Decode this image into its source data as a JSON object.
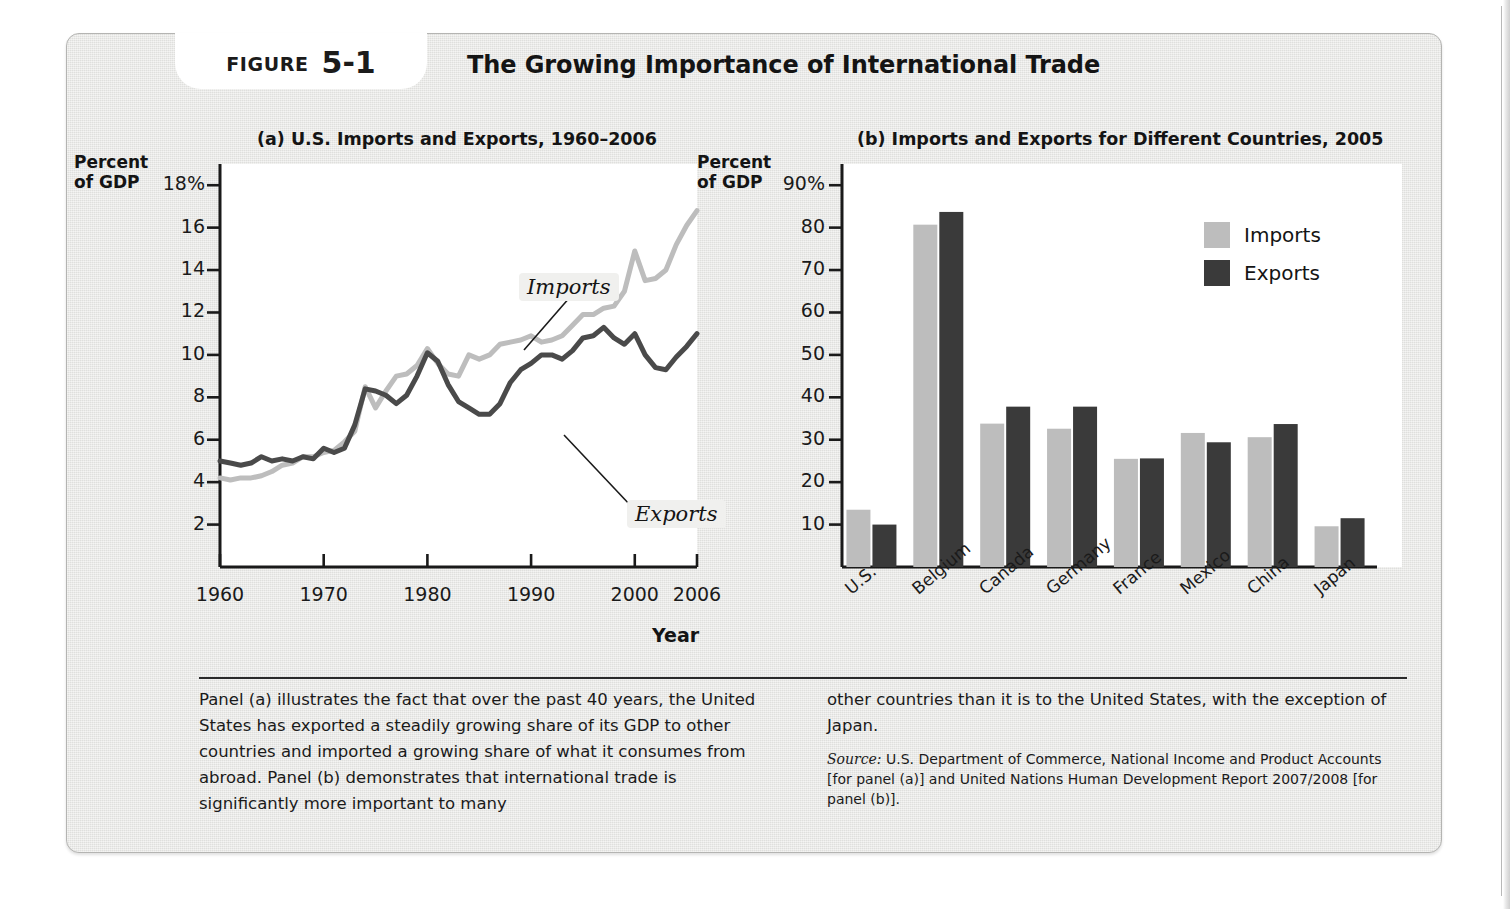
{
  "figure": {
    "label_word": "FIGURE",
    "number": "5-1",
    "title": "The Growing Importance of International Trade"
  },
  "panel_a": {
    "heading": "(a) U.S. Imports and Exports, 1960–2006",
    "y_axis_title_line1": "Percent",
    "y_axis_title_line2": "of GDP",
    "x_axis_title": "Year",
    "callouts": {
      "imports": "Imports",
      "exports": "Exports"
    }
  },
  "panel_b": {
    "heading": "(b) Imports and Exports for Different Countries, 2005",
    "y_axis_title_line1": "Percent",
    "y_axis_title_line2": "of GDP",
    "legend": [
      {
        "label": "Imports",
        "color": "#bdbdbd"
      },
      {
        "label": "Exports",
        "color": "#3a3a3a"
      }
    ]
  },
  "caption": {
    "left": "Panel (a) illustrates the fact that over the past 40 years, the United States has exported a steadily growing share of its GDP to other countries and imported a growing share of what it consumes from abroad. Panel (b) demonstrates that international trade is significantly more important to many",
    "right": "other countries than it is to the United States, with the exception of Japan.",
    "source_word": "Source:",
    "source_text": " U.S. Department of Commerce, National Income and Product Accounts [for panel (a)] and United Nations Human Development Report 2007/2008 [for panel (b)]."
  },
  "colors": {
    "imports": "#bdbdbd",
    "exports": "#4a4a4a",
    "axis": "#1a1a1a",
    "panel_bg": "#e6e6e4",
    "plot_bg": "#ffffff"
  },
  "chart_data": [
    {
      "type": "line",
      "title": "(a) U.S. Imports and Exports, 1960–2006",
      "xlabel": "Year",
      "ylabel": "Percent of GDP",
      "xlim": [
        1960,
        2006
      ],
      "ylim": [
        0,
        19
      ],
      "xticks": [
        1960,
        1970,
        1980,
        1990,
        2000,
        2006
      ],
      "xtick_labels": [
        "1960",
        "1970",
        "1980",
        "1990",
        "2000",
        "2006"
      ],
      "yticks": [
        2,
        4,
        6,
        8,
        10,
        12,
        14,
        16,
        18
      ],
      "ytick_labels": [
        "2",
        "4",
        "6",
        "8",
        "10",
        "12",
        "14",
        "16",
        "18%"
      ],
      "grid": false,
      "legend": "inline-callout",
      "x": [
        1960,
        1961,
        1962,
        1963,
        1964,
        1965,
        1966,
        1967,
        1968,
        1969,
        1970,
        1971,
        1972,
        1973,
        1974,
        1975,
        1976,
        1977,
        1978,
        1979,
        1980,
        1981,
        1982,
        1983,
        1984,
        1985,
        1986,
        1987,
        1988,
        1989,
        1990,
        1991,
        1992,
        1993,
        1994,
        1995,
        1996,
        1997,
        1998,
        1999,
        2000,
        2001,
        2002,
        2003,
        2004,
        2005,
        2006
      ],
      "series": [
        {
          "name": "Imports",
          "color": "#bdbdbd",
          "values": [
            4.2,
            4.1,
            4.2,
            4.2,
            4.3,
            4.5,
            4.8,
            4.9,
            5.2,
            5.2,
            5.4,
            5.5,
            5.9,
            6.4,
            8.5,
            7.5,
            8.3,
            9.0,
            9.1,
            9.5,
            10.3,
            9.6,
            9.1,
            9.0,
            10.0,
            9.8,
            10.0,
            10.5,
            10.6,
            10.7,
            10.9,
            10.6,
            10.7,
            10.9,
            11.4,
            11.9,
            11.9,
            12.2,
            12.3,
            13.0,
            14.9,
            13.5,
            13.6,
            14.0,
            15.2,
            16.1,
            16.8
          ]
        },
        {
          "name": "Exports",
          "color": "#4a4a4a",
          "values": [
            5.0,
            4.9,
            4.8,
            4.9,
            5.2,
            5.0,
            5.1,
            5.0,
            5.2,
            5.1,
            5.6,
            5.4,
            5.6,
            6.7,
            8.4,
            8.3,
            8.1,
            7.7,
            8.1,
            9.0,
            10.1,
            9.7,
            8.6,
            7.8,
            7.5,
            7.2,
            7.2,
            7.7,
            8.7,
            9.3,
            9.6,
            10.0,
            10.0,
            9.8,
            10.2,
            10.8,
            10.9,
            11.3,
            10.8,
            10.5,
            11.0,
            10.0,
            9.4,
            9.3,
            9.9,
            10.4,
            11.0
          ]
        }
      ]
    },
    {
      "type": "bar",
      "title": "(b) Imports and Exports for Different Countries, 2005",
      "xlabel": "",
      "ylabel": "Percent of GDP",
      "ylim": [
        0,
        95
      ],
      "yticks": [
        10,
        20,
        30,
        40,
        50,
        60,
        70,
        80,
        90
      ],
      "ytick_labels": [
        "10",
        "20",
        "30",
        "40",
        "50",
        "60",
        "70",
        "80",
        "90%"
      ],
      "grid": false,
      "legend": "top-right",
      "categories": [
        "U.S.",
        "Belgium",
        "Canada",
        "Germany",
        "France",
        "Mexico",
        "China",
        "Japan"
      ],
      "series": [
        {
          "name": "Imports",
          "color": "#bdbdbd",
          "values": [
            13.5,
            80.7,
            33.8,
            32.6,
            25.5,
            31.6,
            30.6,
            9.6
          ]
        },
        {
          "name": "Exports",
          "color": "#3a3a3a",
          "values": [
            10.0,
            83.7,
            37.8,
            37.8,
            25.6,
            29.4,
            33.7,
            11.5
          ]
        }
      ]
    }
  ]
}
